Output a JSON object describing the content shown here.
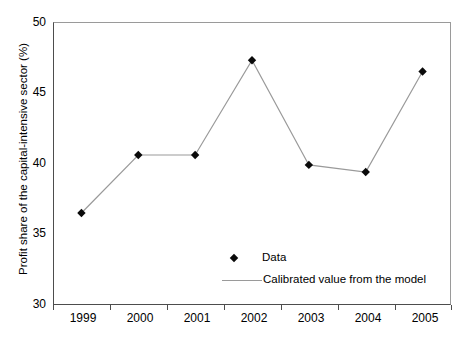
{
  "chart_data": {
    "type": "line",
    "title": "",
    "xlabel": "",
    "ylabel": "Profit share of the capital-intensive sector (%)",
    "categories": [
      "1999",
      "2000",
      "2001",
      "2002",
      "2003",
      "2004",
      "2005"
    ],
    "series": [
      {
        "name": "Data",
        "marker": "diamond",
        "values": [
          36.5,
          40.6,
          40.6,
          47.3,
          39.9,
          39.4,
          46.5
        ]
      }
    ],
    "legend_entries": [
      {
        "label": "Data",
        "marker": "diamond"
      },
      {
        "label": "Calibrated value from the model",
        "marker": "line"
      }
    ],
    "legend_position": "inside-bottom-right",
    "ylim": [
      30,
      50
    ],
    "yticks": [
      30,
      35,
      40,
      45,
      50
    ],
    "ytick_labels": [
      "30",
      "35",
      "40",
      "45",
      "50"
    ],
    "xtick_labels": [
      "1999",
      "2000",
      "2001",
      "2002",
      "2003",
      "2004",
      "2005"
    ],
    "grid": false,
    "colors": {
      "marker": "#0a0a0a",
      "line": "#9a9a9a",
      "axis": "#4d4d4d",
      "frame": "#9a9a9a",
      "background": "#ffffff",
      "text": "#000000"
    }
  }
}
